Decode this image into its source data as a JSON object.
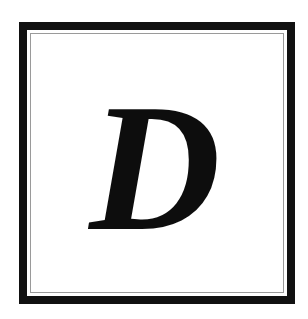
{
  "drop_cap": {
    "letter": "D",
    "letter_color": "#0d0d0d",
    "outer_border_color": "#111111",
    "inner_border_color": "#9a9a9a",
    "background_color": "#ffffff"
  }
}
